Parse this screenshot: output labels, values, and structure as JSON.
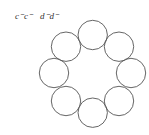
{
  "labels": {
    "left": "c⁻c⁻",
    "right": "d⁻d⁻"
  },
  "diagram": {
    "type": "ring-of-circles",
    "circle_count": 8,
    "stroke_color": "#555555",
    "fill_color": "#ffffff"
  }
}
